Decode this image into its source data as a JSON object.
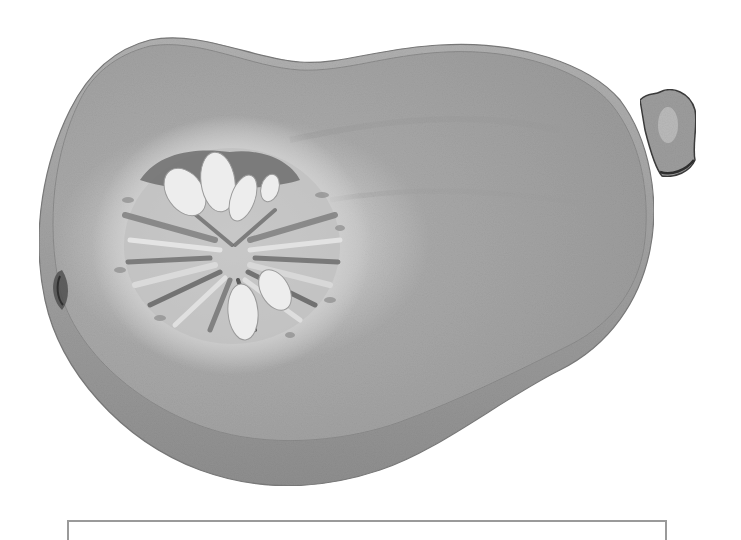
{
  "illustration": {
    "subject": "butternut squash halved, watercolor, grayscale",
    "colors": {
      "background": "#ffffff",
      "skin": "#9c9c9c",
      "skin_dark": "#6e6e6e",
      "flesh": "#a9a9a9",
      "flesh_light": "#c9c9c9",
      "seed_cavity_light": "#d8d8d8",
      "seed": "#ececec",
      "pulp_dark": "#5a5a5a",
      "stem": "#8a8a8a",
      "stem_outline": "#3c3c3c",
      "box_border": "#9a9a9a"
    }
  },
  "caption": {
    "text": ""
  }
}
